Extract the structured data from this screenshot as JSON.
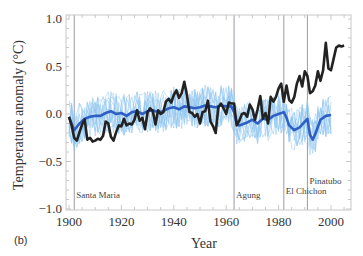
{
  "panel_label": "(b)",
  "chart_data": {
    "type": "line",
    "title": "",
    "xlabel": "Year",
    "ylabel": "Temperature anomaly (°C)",
    "xlim": [
      1899,
      2009
    ],
    "ylim": [
      -1.05,
      1.05
    ],
    "x_ticks": [
      1900,
      1920,
      1940,
      1960,
      1980,
      2000
    ],
    "x_tick_labels": [
      "1900",
      "1920",
      "1940",
      "1960",
      "1980",
      "2000"
    ],
    "y_ticks": [
      1.0,
      0.5,
      0.0,
      -0.5,
      -1.0
    ],
    "y_tick_labels": [
      "1.0",
      "0.5",
      "0.0",
      "−0.5",
      "−1.0"
    ],
    "grid": false,
    "legend": null,
    "annotations": [
      {
        "label": "Santa Maria",
        "year": 1902,
        "label_y": -0.88
      },
      {
        "label": "Agung",
        "year": 1963,
        "label_y": -0.88
      },
      {
        "label": "El Chichon",
        "year": 1982,
        "label_y": -0.84
      },
      {
        "label": "Pinatubo",
        "year": 1991,
        "label_y": -0.74
      }
    ],
    "series": [
      {
        "name": "Observations",
        "color": "#222222",
        "x": [
          1900,
          1901,
          1902,
          1903,
          1904,
          1905,
          1906,
          1907,
          1908,
          1909,
          1910,
          1911,
          1912,
          1913,
          1914,
          1915,
          1916,
          1917,
          1918,
          1919,
          1920,
          1921,
          1922,
          1923,
          1924,
          1925,
          1926,
          1927,
          1928,
          1929,
          1930,
          1931,
          1932,
          1933,
          1934,
          1935,
          1936,
          1937,
          1938,
          1939,
          1940,
          1941,
          1942,
          1943,
          1944,
          1945,
          1946,
          1947,
          1948,
          1949,
          1950,
          1951,
          1952,
          1953,
          1954,
          1955,
          1956,
          1957,
          1958,
          1959,
          1960,
          1961,
          1962,
          1963,
          1964,
          1965,
          1966,
          1967,
          1968,
          1969,
          1970,
          1971,
          1972,
          1973,
          1974,
          1975,
          1976,
          1977,
          1978,
          1979,
          1980,
          1981,
          1982,
          1983,
          1984,
          1985,
          1986,
          1987,
          1988,
          1989,
          1990,
          1991,
          1992,
          1993,
          1994,
          1995,
          1996,
          1997,
          1998,
          1999,
          2000,
          2001,
          2002,
          2003,
          2004,
          2005
        ],
        "values": [
          -0.03,
          -0.12,
          -0.25,
          -0.28,
          -0.19,
          -0.11,
          -0.06,
          -0.27,
          -0.25,
          -0.29,
          -0.28,
          -0.26,
          -0.27,
          -0.23,
          -0.08,
          -0.1,
          -0.24,
          -0.28,
          -0.19,
          -0.12,
          -0.13,
          -0.05,
          -0.12,
          -0.1,
          -0.11,
          -0.06,
          0.04,
          -0.07,
          -0.04,
          -0.16,
          0.02,
          0.06,
          0.03,
          -0.11,
          0.04,
          0.0,
          0.02,
          0.13,
          0.16,
          0.12,
          0.2,
          0.25,
          0.17,
          0.22,
          0.34,
          0.2,
          0.02,
          0.01,
          -0.03,
          0.0,
          -0.1,
          0.02,
          0.03,
          0.14,
          -0.08,
          -0.13,
          -0.2,
          0.07,
          0.11,
          0.06,
          0.0,
          0.12,
          0.11,
          0.11,
          -0.12,
          -0.07,
          0.0,
          0.01,
          -0.03,
          0.1,
          0.05,
          -0.06,
          0.05,
          0.19,
          -0.05,
          0.01,
          -0.1,
          0.18,
          0.13,
          0.18,
          0.27,
          0.32,
          0.13,
          0.3,
          0.15,
          0.12,
          0.18,
          0.32,
          0.4,
          0.29,
          0.45,
          0.4,
          0.22,
          0.24,
          0.3,
          0.45,
          0.35,
          0.46,
          0.75,
          0.48,
          0.46,
          0.58,
          0.7,
          0.72,
          0.71,
          0.72
        ]
      },
      {
        "name": "Ensemble mean",
        "color": "#2f5fc4",
        "x": [
          1900,
          1902,
          1904,
          1906,
          1908,
          1910,
          1912,
          1914,
          1916,
          1918,
          1920,
          1922,
          1924,
          1926,
          1928,
          1930,
          1932,
          1934,
          1936,
          1938,
          1940,
          1942,
          1944,
          1946,
          1948,
          1950,
          1952,
          1954,
          1956,
          1958,
          1960,
          1962,
          1963,
          1964,
          1965,
          1966,
          1968,
          1970,
          1972,
          1974,
          1976,
          1978,
          1980,
          1982,
          1983,
          1984,
          1986,
          1988,
          1990,
          1991,
          1992,
          1993,
          1994,
          1996,
          1998,
          2000
        ],
        "values": [
          -0.03,
          -0.17,
          -0.1,
          -0.05,
          -0.03,
          -0.02,
          -0.02,
          0.01,
          0.03,
          0.0,
          0.01,
          -0.02,
          0.02,
          0.03,
          0.0,
          0.03,
          0.04,
          0.02,
          0.03,
          0.06,
          0.07,
          0.05,
          0.08,
          0.07,
          0.06,
          0.07,
          0.09,
          0.08,
          0.07,
          0.09,
          0.08,
          0.08,
          0.02,
          -0.1,
          -0.12,
          -0.11,
          -0.09,
          -0.06,
          -0.1,
          -0.05,
          -0.06,
          -0.02,
          0.0,
          0.02,
          -0.04,
          -0.12,
          -0.17,
          -0.14,
          -0.08,
          -0.05,
          -0.22,
          -0.27,
          -0.21,
          -0.06,
          -0.02,
          -0.01
        ]
      }
    ],
    "ensemble_members": {
      "name": "Individual simulations",
      "color": "#8cc3ef",
      "count": 12,
      "spread": 0.22
    }
  }
}
